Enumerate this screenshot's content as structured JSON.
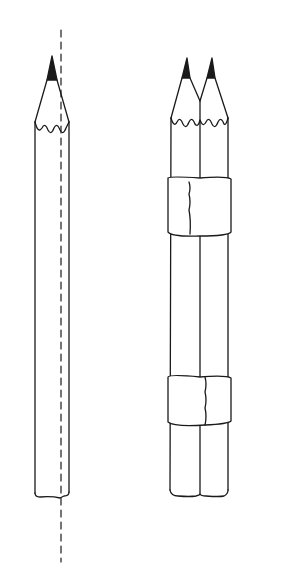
{
  "figure": {
    "background": "#ffffff",
    "stroke": "#1a1a1a",
    "single_pencil": {
      "label": ""
    },
    "taped_pencils": {
      "count": 2,
      "tape_bands": 2
    },
    "axis": {
      "style": "dashed"
    }
  }
}
